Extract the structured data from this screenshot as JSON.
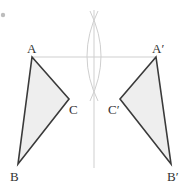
{
  "diagram": {
    "type": "geometry-reflection",
    "colors": {
      "triangle_fill": "#eeeeee",
      "triangle_stroke": "#3a3a3a",
      "construction_line": "#cfcfcf",
      "label": "#333333",
      "corner_dot": "#bdbdbd"
    },
    "original_triangle": {
      "vertices": {
        "A": [
          32,
          57
        ],
        "B": [
          18,
          164
        ],
        "C": [
          69,
          99
        ]
      },
      "labels": {
        "A": "A",
        "B": "B",
        "C": "C"
      }
    },
    "reflected_triangle": {
      "vertices": {
        "A": [
          156,
          57
        ],
        "B": [
          171,
          164
        ],
        "C": [
          120,
          99
        ]
      },
      "labels": {
        "A": "A′",
        "B": "B′",
        "C": "C′"
      }
    },
    "mirror_line": {
      "x": 94,
      "y1": 10,
      "y2": 168
    },
    "connector_AA": {
      "from": "A",
      "to": "A′"
    },
    "compass_arcs": {
      "top_intersection": [
        94,
        15
      ],
      "bottom_intersection": [
        94,
        97
      ]
    }
  }
}
